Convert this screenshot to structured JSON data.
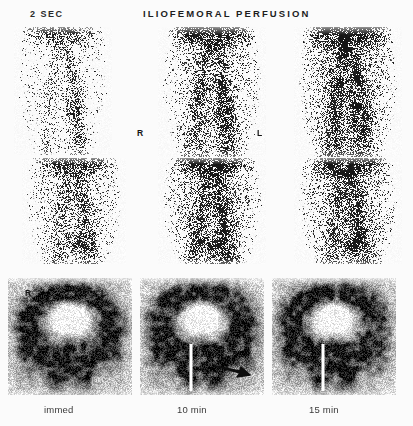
{
  "figure": {
    "title": "ILIOFEMORAL PERFUSION",
    "phase_label": "2 SEC",
    "background_color": "#fbfbfb",
    "ink_color": "#1d1d1d"
  },
  "orientation_markers": {
    "right": "R",
    "left": "L"
  },
  "time_labels": {
    "immediate": "immed",
    "ten_minutes": "10 min",
    "fifteen_minutes": "15 min"
  },
  "annotation": {
    "arrow_name": "arrow-pointer",
    "arrow_color": "#0d0d0d",
    "arrow_direction": "left"
  },
  "panels": [
    {
      "id": "r1c1",
      "row": 1,
      "column": 1,
      "kind": "dynamic-flow",
      "shape": "dome"
    },
    {
      "id": "r1c2",
      "row": 1,
      "column": 2,
      "kind": "dynamic-flow",
      "shape": "dome"
    },
    {
      "id": "r1c3",
      "row": 1,
      "column": 3,
      "kind": "dynamic-flow",
      "shape": "dome"
    },
    {
      "id": "r2c1",
      "row": 2,
      "column": 1,
      "kind": "dynamic-flow",
      "shape": "dome"
    },
    {
      "id": "r2c2",
      "row": 2,
      "column": 2,
      "kind": "dynamic-flow",
      "shape": "dome"
    },
    {
      "id": "r2c3",
      "row": 2,
      "column": 3,
      "kind": "dynamic-flow",
      "shape": "dome"
    },
    {
      "id": "r3c1",
      "row": 3,
      "column": 1,
      "kind": "static-pelvis",
      "shape": "rect",
      "catheter": false
    },
    {
      "id": "r3c2",
      "row": 3,
      "column": 2,
      "kind": "static-pelvis",
      "shape": "rect",
      "catheter": true
    },
    {
      "id": "r3c3",
      "row": 3,
      "column": 3,
      "kind": "static-pelvis",
      "shape": "rect",
      "catheter": true
    }
  ]
}
